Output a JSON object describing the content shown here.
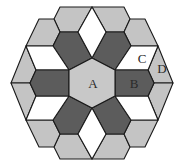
{
  "figure": {
    "center": [
      92,
      83
    ],
    "colors": {
      "A": "#c8c8c8",
      "dark": "#5c5c5c",
      "white": "#ffffff",
      "light": "#c4c4c4",
      "stroke": "#1a1a1a",
      "label": "#2a2a2a"
    },
    "labels": [
      {
        "text": "A",
        "x": 93,
        "y": 85,
        "name": "label-a"
      },
      {
        "text": "B",
        "x": 134,
        "y": 85,
        "name": "label-b"
      },
      {
        "text": "C",
        "x": 142,
        "y": 60,
        "name": "label-c"
      },
      {
        "text": "D",
        "x": 162,
        "y": 70,
        "name": "label-d"
      }
    ]
  }
}
